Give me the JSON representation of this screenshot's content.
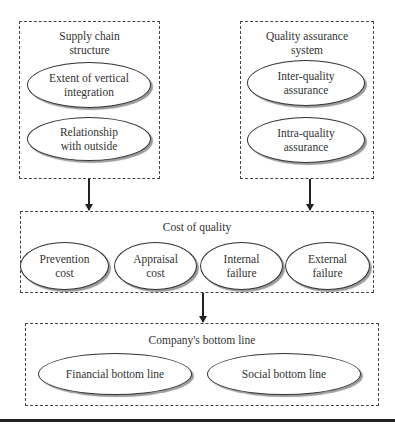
{
  "diagram": {
    "supply_chain": {
      "title": "Supply chain\nstructure",
      "items": [
        "Extent of vertical\nintegration",
        "Relationship\nwith outside"
      ]
    },
    "quality_assurance": {
      "title": "Quality assurance\nsystem",
      "items": [
        "Inter-quality\nassurance",
        "Intra-quality\nassurance"
      ]
    },
    "cost_of_quality": {
      "title": "Cost of quality",
      "items": [
        "Prevention\ncost",
        "Appraisal\ncost",
        "Internal\nfailure",
        "External\nfailure"
      ]
    },
    "bottom_line": {
      "title": "Company's bottom line",
      "items": [
        "Financial bottom line",
        "Social bottom line"
      ]
    },
    "edges": [
      {
        "from": "Supply chain structure",
        "to": "Cost of quality"
      },
      {
        "from": "Quality assurance system",
        "to": "Cost of quality"
      },
      {
        "from": "Cost of quality",
        "to": "Company's bottom line"
      }
    ]
  }
}
